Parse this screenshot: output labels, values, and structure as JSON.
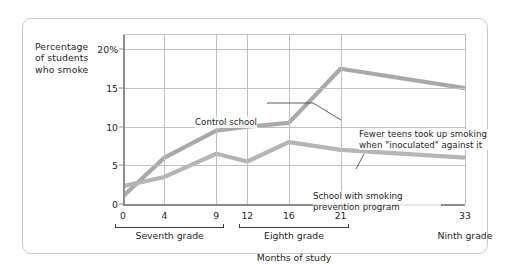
{
  "chart_data": {
    "type": "line",
    "title": "",
    "xlabel": "Months of study",
    "ylabel": "Percentage of students who smoke",
    "x": [
      0,
      4,
      9,
      12,
      16,
      21,
      33
    ],
    "xtick_labels": [
      "0",
      "4",
      "9",
      "12",
      "16",
      "21",
      "33"
    ],
    "ytick_labels": [
      "0",
      "5",
      "10",
      "15",
      "20%"
    ],
    "ytick_values": [
      0,
      5,
      10,
      15,
      20
    ],
    "ylim": [
      0,
      22
    ],
    "grid": true,
    "legend_position": "inline-annotations",
    "series": [
      {
        "name": "Control school",
        "values": [
          1.0,
          6.0,
          9.5,
          10.0,
          10.5,
          17.5,
          15.0
        ],
        "color": "#a9a9a9"
      },
      {
        "name": "School with smoking prevention program",
        "values": [
          2.3,
          3.5,
          6.5,
          5.5,
          8.0,
          7.0,
          6.0
        ],
        "color": "#b5b5b5"
      }
    ],
    "x_groups": [
      {
        "label": "Seventh grade",
        "from": 0,
        "to": 9,
        "bracket": true
      },
      {
        "label": "Eighth grade",
        "from": 12,
        "to": 21,
        "bracket": true
      },
      {
        "label": "Ninth grade",
        "from": 33,
        "to": 33,
        "bracket": false
      }
    ],
    "annotations": [
      {
        "id": "control",
        "text": "Control school"
      },
      {
        "id": "inoculated",
        "text": "Fewer teens took up smoking when \"inoculated\" against it"
      },
      {
        "id": "prevention",
        "text": "School with smoking prevention program"
      }
    ]
  },
  "axis": {
    "y_title_lines": [
      "Percentage",
      "of students",
      "who smoke"
    ],
    "y_title": "Percentage of students who smoke",
    "x_title": "Months of study"
  },
  "colors": {
    "line_control": "#a9a9a9",
    "line_program": "#b5b5b5",
    "grid": "#c0c0c0",
    "axis": "#8d8d8d",
    "text": "#231f20",
    "frame": "#c9c9c9"
  }
}
